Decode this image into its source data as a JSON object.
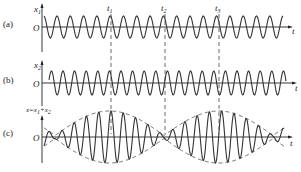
{
  "figure": {
    "panels": [
      {
        "id": "a",
        "tag": "(a)",
        "ylabel_main": "x",
        "ylabel_sub": "1",
        "origin_label": "O",
        "xlabel": "t",
        "axis_y": 27,
        "amplitude": 11,
        "period_px": 13.3,
        "phase_px": 57,
        "x_start": 44,
        "x_end": 283
      },
      {
        "id": "b",
        "tag": "(b)",
        "ylabel_main": "x",
        "ylabel_sub": "2",
        "origin_label": "O",
        "xlabel": "t",
        "axis_y": 83,
        "amplitude": 12,
        "period_px": 11.6,
        "phase_px": 63,
        "x_start": 49,
        "x_end": 286
      },
      {
        "id": "c",
        "tag": "(c)",
        "ylabel_main": "x=x",
        "ylabel_sub": "1",
        "ylabel_rest": "+x",
        "ylabel_sub2": "2",
        "origin_label": "O",
        "xlabel": "t",
        "axis_y": 137,
        "amplitude": 26,
        "carrier_period_px": 12.3,
        "beat_nodes_px": [
          55,
          164,
          272
        ],
        "x_start": 44,
        "x_end": 284
      }
    ],
    "markers": [
      {
        "label": "t",
        "sub": "1",
        "x": 111
      },
      {
        "label": "t",
        "sub": "2",
        "x": 165
      },
      {
        "label": "t",
        "sub": "3",
        "x": 219
      }
    ],
    "y_axis_x": 42,
    "colors": {
      "ink": "#222222",
      "background": "#ffffff"
    }
  }
}
